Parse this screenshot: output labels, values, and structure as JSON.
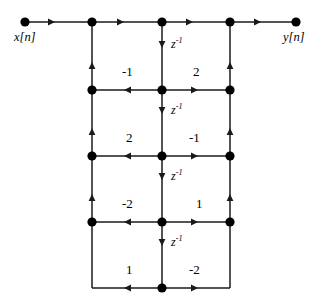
{
  "figure": {
    "type": "signal-flow-graph",
    "background_color": "#ffffff",
    "line_color": "#1a1a1a",
    "node_color": "#000000"
  },
  "io_labels": {
    "input": "x[n]",
    "output": "y[n]"
  },
  "delay_label": {
    "base": "z",
    "exponent": "-1",
    "text": "z-1"
  },
  "delays": [
    {
      "id": "delay-1",
      "label_base": "z",
      "label_exp": "-1",
      "x": 162,
      "y": 56
    },
    {
      "id": "delay-2",
      "label_base": "z",
      "label_exp": "-1",
      "x": 162,
      "y": 122
    },
    {
      "id": "delay-3",
      "label_base": "z",
      "label_exp": "-1",
      "x": 162,
      "y": 188
    },
    {
      "id": "delay-4",
      "label_base": "z",
      "label_exp": "-1",
      "x": 162,
      "y": 254
    }
  ],
  "coefficients": [
    {
      "id": "coef-row2-left",
      "value": "-1",
      "side": "left",
      "row": 2,
      "x": 130,
      "y": 72
    },
    {
      "id": "coef-row2-right",
      "value": "2",
      "side": "right",
      "row": 2,
      "x": 196,
      "y": 72
    },
    {
      "id": "coef-row3-left",
      "value": "2",
      "side": "left",
      "row": 3,
      "x": 130,
      "y": 138
    },
    {
      "id": "coef-row3-right",
      "value": "-1",
      "side": "right",
      "row": 3,
      "x": 196,
      "y": 138
    },
    {
      "id": "coef-row4-left",
      "value": "-2",
      "side": "left",
      "row": 4,
      "x": 130,
      "y": 204
    },
    {
      "id": "coef-row4-right",
      "value": "1",
      "side": "right",
      "row": 4,
      "x": 196,
      "y": 204
    },
    {
      "id": "coef-row5-left",
      "value": "1",
      "side": "left",
      "row": 5,
      "x": 130,
      "y": 270
    },
    {
      "id": "coef-row5-right",
      "value": "-2",
      "side": "right",
      "row": 5,
      "x": 196,
      "y": 270
    }
  ],
  "geometry": {
    "columns": {
      "input": 25,
      "left": 92,
      "center": 162,
      "right": 230,
      "output": 296
    },
    "rows": [
      22,
      90,
      156,
      222,
      288
    ],
    "node_radius": 4.6,
    "bottom_corner_row": 288
  },
  "nodes": [
    {
      "id": "node-input",
      "x": 25,
      "y": 22,
      "kind": "terminal"
    },
    {
      "id": "node-top-left",
      "x": 92,
      "y": 22,
      "kind": "junction"
    },
    {
      "id": "node-top-center",
      "x": 162,
      "y": 22,
      "kind": "junction"
    },
    {
      "id": "node-top-right",
      "x": 230,
      "y": 22,
      "kind": "junction"
    },
    {
      "id": "node-output",
      "x": 296,
      "y": 22,
      "kind": "terminal"
    },
    {
      "id": "node-r2-left",
      "x": 92,
      "y": 90,
      "kind": "junction"
    },
    {
      "id": "node-r2-center",
      "x": 162,
      "y": 90,
      "kind": "junction"
    },
    {
      "id": "node-r2-right",
      "x": 230,
      "y": 90,
      "kind": "junction"
    },
    {
      "id": "node-r3-left",
      "x": 92,
      "y": 156,
      "kind": "junction"
    },
    {
      "id": "node-r3-center",
      "x": 162,
      "y": 156,
      "kind": "junction"
    },
    {
      "id": "node-r3-right",
      "x": 230,
      "y": 156,
      "kind": "junction"
    },
    {
      "id": "node-r4-left",
      "x": 92,
      "y": 222,
      "kind": "junction"
    },
    {
      "id": "node-r4-center",
      "x": 162,
      "y": 222,
      "kind": "junction"
    },
    {
      "id": "node-r4-right",
      "x": 230,
      "y": 222,
      "kind": "junction"
    },
    {
      "id": "node-r5-center",
      "x": 162,
      "y": 288,
      "kind": "junction"
    }
  ]
}
